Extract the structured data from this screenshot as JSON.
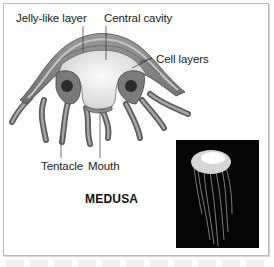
{
  "figure": {
    "title": "MEDUSA",
    "labels": {
      "jelly_layer": "Jelly-like layer",
      "central_cavity": "Central cavity",
      "cell_layers": "Cell layers",
      "tentacle": "Tentacle",
      "mouth": "Mouth"
    },
    "photo": {
      "subject": "jellyfish-photo",
      "background_color": "#050505"
    },
    "colors": {
      "frame_border": "#b9b9b9",
      "body_outer": "#8c8c8c",
      "body_inner": "#e6e6e6",
      "text": "#1a1a1a"
    }
  }
}
